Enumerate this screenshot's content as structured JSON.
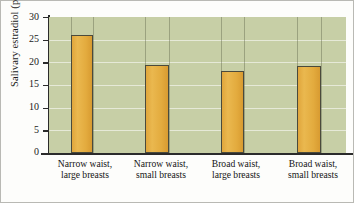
{
  "chart_data": {
    "type": "bar",
    "title": "",
    "xlabel": "",
    "ylabel": "Salivary estradiol (pmol/liter)",
    "ylim": [
      0,
      30
    ],
    "ytick_step": 5,
    "yticks": [
      30,
      25,
      20,
      15,
      10,
      5,
      0
    ],
    "grid": true,
    "grid_orientation": "horizontal",
    "legend": "none",
    "categories": [
      {
        "line1": "Narrow waist,",
        "line2": "large breasts"
      },
      {
        "line1": "Narrow waist,",
        "line2": "small breasts"
      },
      {
        "line1": "Broad waist,",
        "line2": "large breasts"
      },
      {
        "line1": "Broad waist,",
        "line2": "small breasts"
      }
    ],
    "category_labels": [
      "Narrow waist, large breasts",
      "Narrow waist, small breasts",
      "Broad waist, large breasts",
      "Broad waist, small breasts"
    ],
    "values": [
      26.1,
      19.4,
      18.2,
      19.1
    ],
    "units": "pmol/liter",
    "colors": {
      "bar_fill": "#e3ab3e",
      "bar_edge": "#4a4a3c",
      "panel_background": "#c7cfa6",
      "gridline": "#ffffff",
      "axis": "#2b2b2b",
      "text": "#151515",
      "page_background": "#fdfdfb"
    }
  }
}
